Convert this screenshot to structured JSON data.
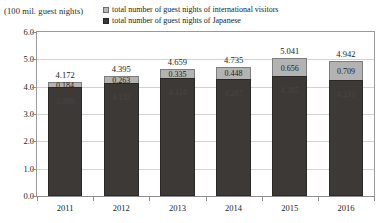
{
  "axis_unit_caption": "(100 mil. guest nights)",
  "legend": {
    "items": [
      {
        "label": "total number of guest nights of international visitors",
        "color": "#b3b3b3",
        "key": "international"
      },
      {
        "label": "total number of guest nights of Japanese",
        "color": "#3c3936",
        "key": "japanese"
      }
    ]
  },
  "chart_data": {
    "type": "bar",
    "stacked": true,
    "title": "",
    "subtitle": "",
    "xlabel": "",
    "ylabel": "(100 mil. guest nights)",
    "categories": [
      "2011",
      "2012",
      "2013",
      "2014",
      "2015",
      "2016"
    ],
    "series": [
      {
        "name": "total number of guest nights of Japanese",
        "color": "#3c3936",
        "values": [
          3.988,
          4.132,
          4.324,
          4.287,
          4.385,
          4.233
        ],
        "value_labels": [
          "3.988",
          "4.132",
          "4.324",
          "4.287",
          "4.385",
          "4.233"
        ]
      },
      {
        "name": "total number of guest nights of international visitors",
        "color": "#b3b3b3",
        "values": [
          0.184,
          0.263,
          0.335,
          0.448,
          0.656,
          0.709
        ],
        "value_labels": [
          "0.184",
          "0.263",
          "0.335",
          "0.448",
          "0.656",
          "0.709"
        ]
      }
    ],
    "totals": [
      4.172,
      4.395,
      4.659,
      4.735,
      5.041,
      4.942
    ],
    "total_labels": [
      "4.172",
      "4.395",
      "4.659",
      "4.735",
      "5.041",
      "4.942"
    ],
    "ylim": [
      0.0,
      6.0
    ],
    "ytick_step": 1.0,
    "ytick_labels": [
      "6.0",
      "5.0",
      "4.0",
      "3.0",
      "2.0",
      "1.0",
      "0.0"
    ],
    "ytick_values": [
      6.0,
      5.0,
      4.0,
      3.0,
      2.0,
      1.0,
      0.0
    ],
    "grid": true,
    "legend_position": "top"
  }
}
